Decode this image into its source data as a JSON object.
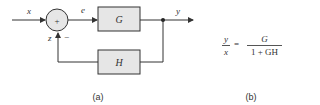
{
  "diagram": {
    "type": "feedback-block-diagram",
    "signals": {
      "input": "x",
      "error": "e",
      "output": "y",
      "feedback": "z"
    },
    "summing_junction": {
      "symbol": "+",
      "feedback_sign": "−"
    },
    "blocks": {
      "forward": "G",
      "feedback": "H"
    },
    "caption_a": "(a)"
  },
  "formula": {
    "lhs_num": "y",
    "lhs_den": "x",
    "equals": "=",
    "rhs_num": "G",
    "rhs_den": "1 + GH"
  },
  "caption_b": "(b)",
  "colors": {
    "line": "#333333",
    "block_fill": "#e6e6e6",
    "text": "#333333"
  }
}
